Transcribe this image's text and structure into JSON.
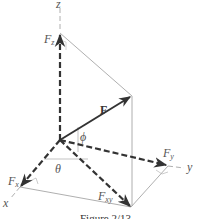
{
  "figure": {
    "caption": "Figure 2/13",
    "axes": {
      "x": "x",
      "y": "y",
      "z": "z"
    },
    "vectors": {
      "F": "F",
      "Fz": {
        "base": "F",
        "sub": "z"
      },
      "Fy": {
        "base": "F",
        "sub": "y"
      },
      "Fx": {
        "base": "F",
        "sub": "x"
      },
      "Fxy": {
        "base": "F",
        "sub": "xy"
      }
    },
    "angles": {
      "theta": "θ",
      "phi": "ϕ"
    },
    "colors": {
      "vector": "#333333",
      "axis": "#999999",
      "construction": "#9a9a9a"
    }
  }
}
